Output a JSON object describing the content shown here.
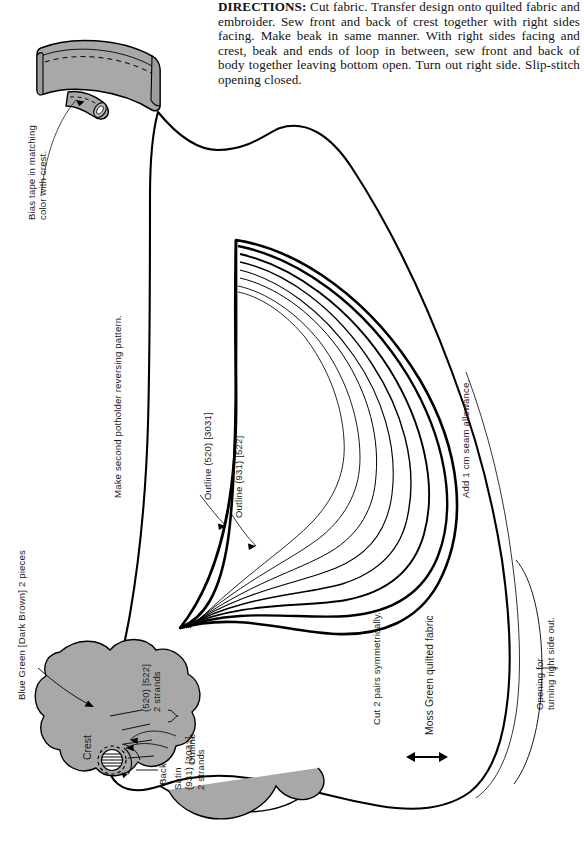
{
  "document": {
    "type": "sewing-pattern-sheet",
    "subject": "Bird potholder pattern with crest, beak, wing and hanging loop",
    "page_width": 584,
    "page_height": 851,
    "background_color": "#ffffff",
    "ink_color": "#000000",
    "fabric_fill_color": "#a8a8a8"
  },
  "directions": {
    "heading": "DIRECTIONS:",
    "body": " Cut fabric. Transfer design onto quilted fabric and embroider. Sew front and back of crest together with right sides facing. Make beak in same manner. With right sides facing and crest, beak and ends of loop in between, sew front and back of body together leaving bottom open. Turn out right side. Slip-stitch opening closed."
  },
  "labels": {
    "bias_tape": "Bias tape in matching\ncolor with crest.",
    "make_second": "Make second potholder reversing pattern.",
    "outline_520": "Outline (520) [3031]",
    "outline_931": "Outline (931) [522]",
    "seam_allowance": "Add 1 cm seam allowance.",
    "opening": "Opening for\nturning right side out.",
    "moss_green": "Moss Green quilted fabric",
    "cut_pairs": "Cut 2 pairs symmetrically.",
    "blue_green": "Blue Green [Dark Brown] 2 pieces",
    "crest": "Crest",
    "satin": "Satin\n(931) [3031]\n2 strands",
    "back": "Back",
    "outline_small": "Outline",
    "strands_520": "(520) [522]\n2 strands"
  },
  "floss_codes": {
    "outline_wing_outer": {
      "dmc": "520",
      "alt": "3031"
    },
    "outline_wing_inner": {
      "dmc": "931",
      "alt": "522"
    },
    "satin_eye": {
      "dmc": "931",
      "alt": "3031",
      "strands": 2
    },
    "outline_eye": {
      "dmc": "520",
      "alt": "522",
      "strands": 2
    }
  },
  "icons": {
    "arrow_grain": "double-headed-arrow-icon",
    "pointer_leader": "leader-line-arrow-icon"
  }
}
